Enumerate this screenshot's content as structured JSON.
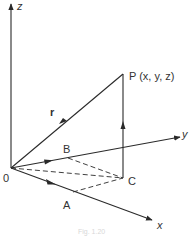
{
  "diagram": {
    "colors": {
      "line": "#2a2a2a",
      "text": "#333333",
      "caption": "#d8d8d8"
    },
    "labels": {
      "origin": "0",
      "z_axis": "z",
      "y_axis": "y",
      "x_axis": "x",
      "point_p": "P (x, y, z)",
      "point_a": "A",
      "point_b": "B",
      "point_c": "C",
      "vector_r": "r"
    },
    "caption": "Fig. 1.20",
    "nodes": [
      {
        "id": "O",
        "label": "0",
        "x": 11,
        "y": 168
      },
      {
        "id": "A",
        "label": "A",
        "x": 73,
        "y": 192
      },
      {
        "id": "B",
        "label": "B",
        "x": 68,
        "y": 158
      },
      {
        "id": "C",
        "label": "C",
        "x": 123,
        "y": 178
      },
      {
        "id": "P",
        "label": "P (x, y, z)",
        "x": 123,
        "y": 74
      }
    ],
    "edges": [
      {
        "from": "O",
        "to": "z-axis",
        "style": "solid",
        "arrow": true
      },
      {
        "from": "O",
        "to": "y-axis",
        "style": "solid",
        "arrow": true
      },
      {
        "from": "O",
        "to": "x-axis",
        "style": "solid",
        "arrow": true
      },
      {
        "from": "O",
        "to": "P",
        "label": "r",
        "style": "solid",
        "arrow": "mid"
      },
      {
        "from": "C",
        "to": "P",
        "style": "solid",
        "arrow": "mid"
      },
      {
        "from": "O",
        "to": "B",
        "style": "solid",
        "arrow": "mid"
      },
      {
        "from": "O",
        "to": "A",
        "style": "solid",
        "arrow": "mid"
      },
      {
        "from": "O",
        "to": "C",
        "style": "dashed"
      },
      {
        "from": "B",
        "to": "C",
        "style": "dashed"
      },
      {
        "from": "A",
        "to": "C",
        "style": "dashed"
      }
    ]
  }
}
